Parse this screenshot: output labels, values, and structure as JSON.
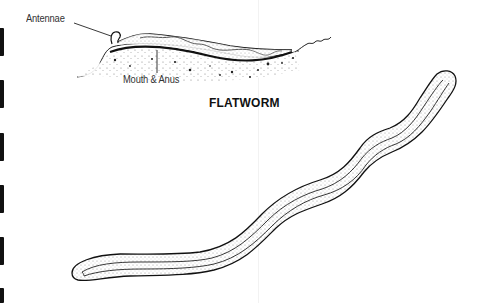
{
  "diagram": {
    "title": "FLATWORM",
    "labels": {
      "antennae": "Antennae",
      "mouth_anus": "Mouth & Anus"
    },
    "figures": [
      {
        "name": "flatworm-side-view",
        "description": "Flatworm resting on ground, side view with antennae and mouth & anus labeled"
      },
      {
        "name": "worm-top-view",
        "description": "Long wavy worm body with stippled longitudinal stripes"
      }
    ],
    "colors": {
      "ink": "#111111",
      "label_text": "#333333",
      "background": "#ffffff",
      "stipple": "#bdbdbd"
    }
  }
}
